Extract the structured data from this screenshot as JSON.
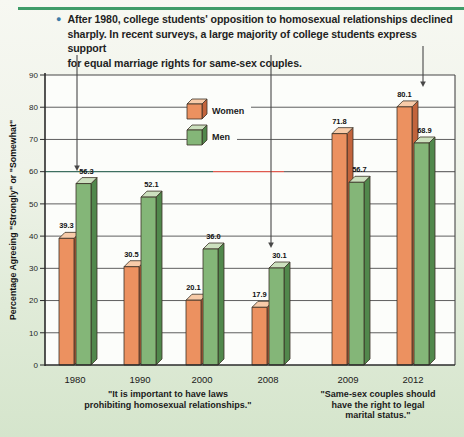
{
  "page": {
    "rule_color": "#3f9c68",
    "bullet_color": "#3e7ca8",
    "bullet_glyph": "●"
  },
  "note": {
    "lines": [
      "After 1980, college students' opposition to homosexual relationships declined",
      "sharply. In recent surveys, a large majority of college students express support",
      "for equal marriage rights for same-sex couples."
    ]
  },
  "chart_data": {
    "type": "bar",
    "style": "3d-prism-bars",
    "ylabel": "Percentage Agreeing \"Strongly\" or \"Somewhat\"",
    "ylim": [
      0,
      90
    ],
    "ytick_step": 10,
    "grid": true,
    "legend_position": "top-center-inside",
    "categories": [
      "1980",
      "1990",
      "2000",
      "2008",
      "2009",
      "2012"
    ],
    "series": [
      {
        "name": "Women",
        "values": [
          39.3,
          30.5,
          20.1,
          17.9,
          71.8,
          80.1
        ],
        "color_front": "#EC9160",
        "color_top": "#F7CBA9",
        "color_side": "#C2643C"
      },
      {
        "name": "Men",
        "values": [
          56.3,
          52.1,
          36.0,
          30.1,
          56.7,
          68.9
        ],
        "color_front": "#84B678",
        "color_top": "#CCE0BE",
        "color_side": "#51884C"
      }
    ],
    "value_labels_shown": true,
    "captions": {
      "left_lines": [
        "\"It is important to have laws",
        "prohibiting homosexual relationships.\""
      ],
      "right_lines": [
        "\"Same-sex couples should",
        "have the right to legal",
        "marital status.\""
      ]
    },
    "annotations": {
      "callouts": [
        {
          "target_category": "1980",
          "x": 77,
          "y1": 55,
          "y2": 171
        },
        {
          "target_category": "2008",
          "x": 271,
          "y1": 55,
          "y2": 248
        },
        {
          "target_category": "2012",
          "x": 423,
          "y1": 46,
          "y2": 87
        }
      ],
      "special_gridline": {
        "value": 60,
        "segments": [
          {
            "x1": 45,
            "x2": 213,
            "color": "#3e6f60"
          },
          {
            "x1": 213,
            "x2": 284,
            "color": "#df5a4e"
          },
          {
            "x1": 284,
            "x2": 455,
            "color": "#6f6f6f"
          }
        ]
      }
    }
  }
}
